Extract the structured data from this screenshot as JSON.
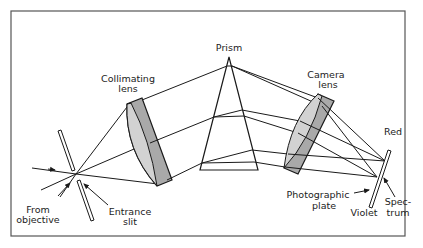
{
  "diagram": {
    "type": "prism spectrograph optical layout",
    "labels": {
      "prism": "Prism",
      "collimating_lens_1": "Collimating",
      "collimating_lens_2": "lens",
      "camera_lens_1": "Camera",
      "camera_lens_2": "lens",
      "red": "Red",
      "violet": "Violet",
      "spectrum_1": "Spec-",
      "spectrum_2": "trum",
      "photographic_plate_1": "Photographic",
      "photographic_plate_2": "plate",
      "from_objective_1": "From",
      "from_objective_2": "objective",
      "entrance_slit_1": "Entrance",
      "entrance_slit_2": "slit"
    },
    "colors": {
      "line": "#1a1a1a",
      "lens_light": "#cfcfcf",
      "lens_dark": "#a9a9a9",
      "border": "#555555",
      "background": "#ffffff"
    }
  }
}
